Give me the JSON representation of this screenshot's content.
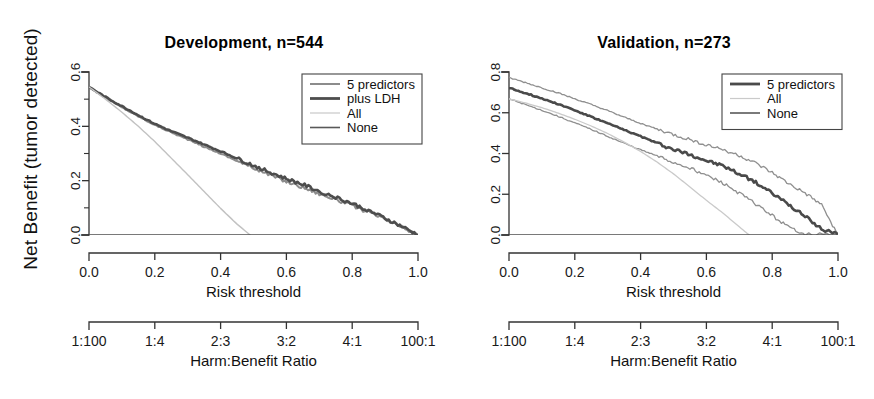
{
  "figure": {
    "ylabel": "Net Benefit (tumor detected)",
    "panel_count": 2
  },
  "chart_data": [
    {
      "type": "line",
      "title": "Development, n=544",
      "xlabel": "Risk threshold",
      "xlabel2": "Harm:Benefit Ratio",
      "ylabel": "Net Benefit (tumor detected)",
      "xlim": [
        0.0,
        1.0
      ],
      "ylim": [
        0.0,
        0.6
      ],
      "grid": false,
      "legend_position": "top-right",
      "xticks": [
        "0.0",
        "0.2",
        "0.4",
        "0.6",
        "0.8",
        "1.0"
      ],
      "xtick_values": [
        0.0,
        0.2,
        0.4,
        0.6,
        0.8,
        1.0
      ],
      "xticks2": [
        "1:100",
        "1:4",
        "2:3",
        "3:2",
        "4:1",
        "100:1"
      ],
      "yticks": [
        "0.0",
        "0.2",
        "0.4",
        "0.6"
      ],
      "ytick_values": [
        0.0,
        0.2,
        0.4,
        0.6
      ],
      "yminor_values": [
        0.1,
        0.3,
        0.5
      ],
      "series": [
        {
          "name": "5 predictors",
          "color": "#8c8c8c",
          "width": 2.0,
          "x": [
            0.0,
            0.05,
            0.1,
            0.15,
            0.2,
            0.25,
            0.3,
            0.35,
            0.4,
            0.45,
            0.5,
            0.55,
            0.6,
            0.65,
            0.7,
            0.75,
            0.8,
            0.85,
            0.9,
            0.95,
            1.0
          ],
          "values": [
            0.545,
            0.505,
            0.47,
            0.437,
            0.405,
            0.378,
            0.352,
            0.325,
            0.3,
            0.273,
            0.247,
            0.222,
            0.197,
            0.176,
            0.152,
            0.131,
            0.108,
            0.083,
            0.057,
            0.029,
            0.0
          ]
        },
        {
          "name": "plus LDH",
          "color": "#4d4d4d",
          "width": 2.6,
          "x": [
            0.0,
            0.05,
            0.1,
            0.15,
            0.2,
            0.25,
            0.3,
            0.35,
            0.4,
            0.45,
            0.5,
            0.55,
            0.6,
            0.65,
            0.7,
            0.75,
            0.8,
            0.85,
            0.9,
            0.95,
            1.0
          ],
          "values": [
            0.545,
            0.508,
            0.474,
            0.441,
            0.409,
            0.382,
            0.358,
            0.333,
            0.308,
            0.282,
            0.256,
            0.231,
            0.207,
            0.186,
            0.161,
            0.139,
            0.116,
            0.09,
            0.062,
            0.032,
            0.0
          ]
        },
        {
          "name": "All",
          "color": "#c2c2c2",
          "width": 1.4,
          "x": [
            0.0,
            0.05,
            0.1,
            0.15,
            0.2,
            0.25,
            0.3,
            0.35,
            0.4,
            0.45,
            0.5,
            0.55,
            0.57
          ],
          "values": [
            0.545,
            0.5,
            0.452,
            0.4,
            0.344,
            0.283,
            0.222,
            0.16,
            0.098,
            0.04,
            -0.01,
            -0.06,
            -0.07
          ]
        },
        {
          "name": "None",
          "color": "#4d4d4d",
          "width": 1.6,
          "x": [
            0.0,
            1.0
          ],
          "values": [
            0.0,
            0.0
          ]
        }
      ],
      "legend": [
        {
          "label": "5 predictors",
          "color": "#8c8c8c",
          "width": 2.0
        },
        {
          "label": "plus LDH",
          "color": "#4d4d4d",
          "width": 2.8
        },
        {
          "label": "All",
          "color": "#c8c8c8",
          "width": 1.2
        },
        {
          "label": "None",
          "color": "#595959",
          "width": 1.6
        }
      ]
    },
    {
      "type": "line",
      "title": "Validation, n=273",
      "xlabel": "Risk threshold",
      "xlabel2": "Harm:Benefit Ratio",
      "ylabel": "Net Benefit (tumor detected)",
      "xlim": [
        0.0,
        1.0
      ],
      "ylim": [
        0.0,
        0.8
      ],
      "grid": false,
      "legend_position": "top-right",
      "xticks": [
        "0.0",
        "0.2",
        "0.4",
        "0.6",
        "0.8",
        "1.0"
      ],
      "xtick_values": [
        0.0,
        0.2,
        0.4,
        0.6,
        0.8,
        1.0
      ],
      "xticks2": [
        "1:100",
        "1:4",
        "2:3",
        "3:2",
        "4:1",
        "100:1"
      ],
      "yticks": [
        "0.0",
        "0.2",
        "0.4",
        "0.6",
        "0.8"
      ],
      "ytick_values": [
        0.0,
        0.2,
        0.4,
        0.6,
        0.8
      ],
      "series": [
        {
          "name": "5 predictors upper CI",
          "color": "#8f8f8f",
          "width": 1.3,
          "x": [
            0.0,
            0.05,
            0.1,
            0.15,
            0.2,
            0.25,
            0.3,
            0.35,
            0.4,
            0.45,
            0.5,
            0.55,
            0.6,
            0.65,
            0.7,
            0.75,
            0.8,
            0.85,
            0.9,
            0.95,
            1.0
          ],
          "values": [
            0.772,
            0.748,
            0.722,
            0.697,
            0.668,
            0.64,
            0.61,
            0.578,
            0.548,
            0.52,
            0.492,
            0.468,
            0.443,
            0.42,
            0.39,
            0.352,
            0.305,
            0.252,
            0.205,
            0.148,
            0.0
          ]
        },
        {
          "name": "5 predictors",
          "color": "#4a4a4a",
          "width": 2.6,
          "x": [
            0.0,
            0.05,
            0.1,
            0.15,
            0.2,
            0.25,
            0.3,
            0.35,
            0.4,
            0.45,
            0.5,
            0.55,
            0.6,
            0.65,
            0.7,
            0.75,
            0.8,
            0.85,
            0.9,
            0.95,
            1.0
          ],
          "values": [
            0.722,
            0.697,
            0.67,
            0.643,
            0.612,
            0.58,
            0.548,
            0.516,
            0.484,
            0.452,
            0.42,
            0.396,
            0.365,
            0.34,
            0.3,
            0.258,
            0.205,
            0.15,
            0.09,
            0.03,
            0.0
          ]
        },
        {
          "name": "5 predictors lower CI",
          "color": "#8f8f8f",
          "width": 1.3,
          "x": [
            0.0,
            0.05,
            0.1,
            0.15,
            0.2,
            0.25,
            0.3,
            0.35,
            0.4,
            0.45,
            0.5,
            0.55,
            0.6,
            0.65,
            0.7,
            0.75,
            0.8,
            0.85,
            0.9,
            1.0
          ],
          "values": [
            0.668,
            0.64,
            0.612,
            0.582,
            0.55,
            0.518,
            0.484,
            0.45,
            0.418,
            0.388,
            0.355,
            0.33,
            0.292,
            0.255,
            0.205,
            0.152,
            0.095,
            0.038,
            0.005,
            0.0
          ]
        },
        {
          "name": "All",
          "color": "#cacaca",
          "width": 1.3,
          "x": [
            0.0,
            0.05,
            0.1,
            0.15,
            0.2,
            0.25,
            0.3,
            0.35,
            0.4,
            0.45,
            0.5,
            0.55,
            0.6,
            0.65,
            0.7,
            0.73,
            0.76
          ],
          "values": [
            0.668,
            0.648,
            0.625,
            0.598,
            0.568,
            0.535,
            0.498,
            0.456,
            0.41,
            0.358,
            0.3,
            0.236,
            0.17,
            0.108,
            0.04,
            0.0,
            -0.045
          ]
        },
        {
          "name": "None",
          "color": "#4d4d4d",
          "width": 1.6,
          "x": [
            0.0,
            1.0
          ],
          "values": [
            0.0,
            0.0
          ]
        }
      ],
      "legend": [
        {
          "label": "5 predictors",
          "color": "#4a4a4a",
          "width": 2.8
        },
        {
          "label": "All",
          "color": "#cacaca",
          "width": 1.2
        },
        {
          "label": "None",
          "color": "#595959",
          "width": 1.6
        }
      ]
    }
  ]
}
